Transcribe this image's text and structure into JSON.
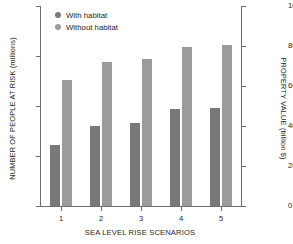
{
  "chart_data": {
    "type": "bar",
    "title": "",
    "xlabel": "SEA LEVEL RISE SCENARIOS",
    "ylabel": "NUMBER OF PEOPLE AT RISK (millions)",
    "ylabel_right": "PROPERTY VALUE (billion $)",
    "categories": [
      "1",
      "2",
      "3",
      "4",
      "5"
    ],
    "series": [
      {
        "name": "With habitat",
        "color": "#797979",
        "values": [
          1.22,
          1.6,
          1.66,
          1.94,
          1.96
        ]
      },
      {
        "name": "Without habitat",
        "color": "#9b9b9b",
        "values": [
          2.52,
          2.88,
          2.95,
          3.18,
          3.23
        ]
      }
    ],
    "ylim": [
      0,
      4
    ],
    "yticks": [
      "0",
      "1",
      "2",
      "3",
      "4"
    ],
    "ylim_right": [
      0,
      1000
    ],
    "yticks_right": [
      "0",
      "200",
      "400",
      "600",
      "800",
      "1000"
    ],
    "grid": false,
    "legend_position": "top-left",
    "axis_color": "#6e6e6e"
  },
  "legend": {
    "items": [
      {
        "label": "With habitat"
      },
      {
        "label": "Without habitat"
      }
    ]
  }
}
